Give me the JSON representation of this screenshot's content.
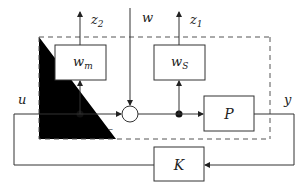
{
  "diagram": {
    "type": "block-diagram",
    "blocks": {
      "wm": {
        "label": "w",
        "sub": "m"
      },
      "ws": {
        "label": "w",
        "sub": "S"
      },
      "plant": {
        "label": "P"
      },
      "controller": {
        "label": "K"
      }
    },
    "signals": {
      "z2": {
        "label": "z",
        "sub": "2"
      },
      "z1": {
        "label": "z",
        "sub": "1"
      },
      "w": {
        "label": "w"
      },
      "u": {
        "label": "u"
      },
      "y": {
        "label": "y"
      }
    },
    "summing_junction": {
      "sign": "–"
    },
    "colors": {
      "line": "#333333",
      "dashed": "#555555",
      "fill": "#ffffff"
    }
  }
}
